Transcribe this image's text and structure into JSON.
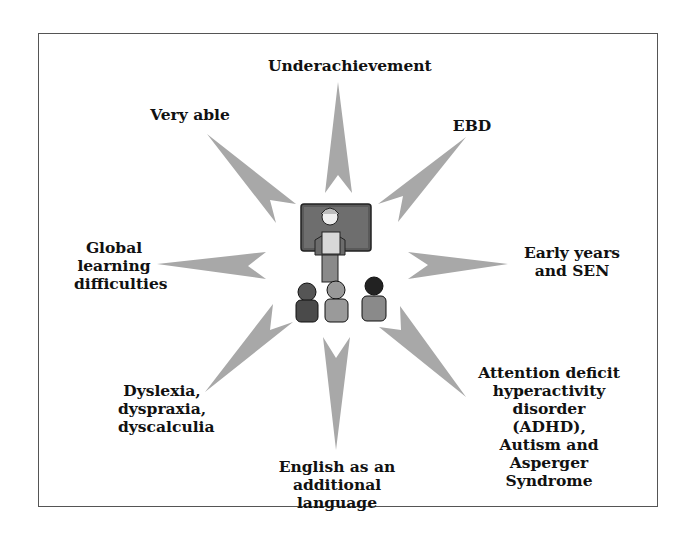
{
  "diagram": {
    "center_image": "teacher-with-pupils-illustration",
    "labels": [
      {
        "id": "underachievement",
        "text": "Underachievement"
      },
      {
        "id": "very-able",
        "text": "Very able"
      },
      {
        "id": "ebd",
        "text": "EBD"
      },
      {
        "id": "global-learning",
        "text": "Global\nlearning\ndifficulties"
      },
      {
        "id": "early-years",
        "text": "Early years\nand SEN"
      },
      {
        "id": "dyslexia",
        "text": "Dyslexia,\ndyspraxia,\ndyscalculia"
      },
      {
        "id": "adhd",
        "text": "Attention deficit\nhyperactivity\ndisorder (ADHD),\nAutism and\nAsperger Syndrome"
      },
      {
        "id": "eal",
        "text": "English as an\nadditional language"
      }
    ],
    "colors": {
      "arrow": "#a8a8a8",
      "frame": "#555555",
      "board": "#5a5a5a"
    }
  }
}
